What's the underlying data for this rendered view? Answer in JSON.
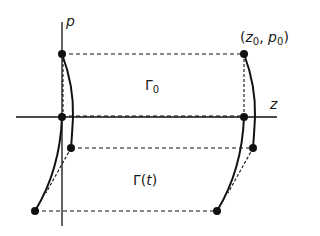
{
  "diagram": {
    "axes": {
      "z_label": "z",
      "p_label": "p"
    },
    "labels": {
      "point_label_open": "(",
      "point_label_z": "z",
      "point_label_z_sub": "0",
      "point_label_sep": ", ",
      "point_label_p": "p",
      "point_label_p_sub": "0",
      "point_label_close": ")",
      "gamma0_symbol": "Γ",
      "gamma0_sub": "0",
      "gammat_symbol": "Γ",
      "gammat_open": "(",
      "gammat_var": "t",
      "gammat_close": ")"
    },
    "colors": {
      "ink": "#111111",
      "background": "#ffffff"
    }
  }
}
